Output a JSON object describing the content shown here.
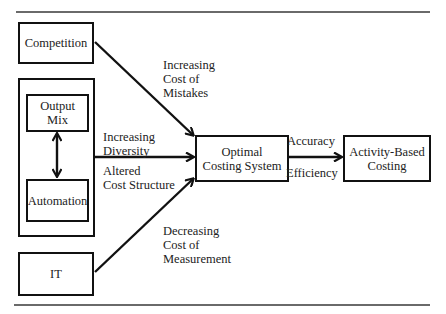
{
  "diagram": {
    "nodes": {
      "competition": "Competition",
      "output_mix": "Output\nMix",
      "automation": "Automation",
      "it": "IT",
      "optimal": "Optimal\nCosting System",
      "abc": "Activity-Based\nCosting"
    },
    "edge_labels": {
      "competition_to_optimal": "Increasing\nCost of\nMistakes",
      "diversity": "Increasing\nDiversity",
      "cost_structure": "Altered\nCost Structure",
      "it_to_optimal": "Decreasing\nCost of\nMeasurement",
      "accuracy": "Accuracy",
      "efficiency": "Efficiency"
    },
    "colors": {
      "stroke": "#111111",
      "rule": "#6a6a6a",
      "text": "#222222"
    }
  }
}
